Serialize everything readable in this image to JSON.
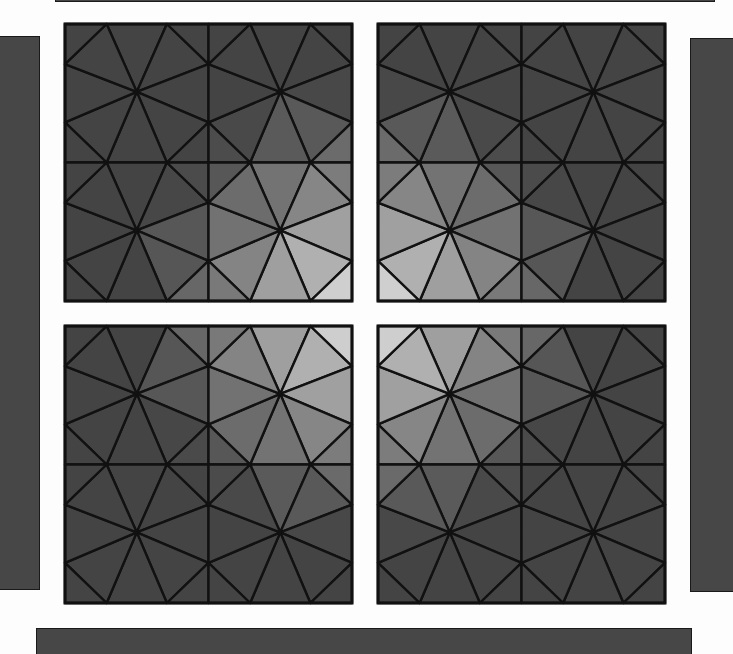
{
  "canvas": {
    "width": 733,
    "height": 654,
    "background": "#fdfdfd"
  },
  "center": {
    "x": 365,
    "y": 313
  },
  "colors": {
    "line": "#111111",
    "bar_fill": "#474747",
    "lightest": "#e8e8e8",
    "darkest": "#454545"
  },
  "bars": [
    {
      "name": "top-bar-edge",
      "x": 55,
      "y": -8,
      "w": 660,
      "h": 10
    },
    {
      "name": "left-bar",
      "x": -2,
      "y": 36,
      "w": 42,
      "h": 554
    },
    {
      "name": "right-bar",
      "x": 690,
      "y": 38,
      "w": 45,
      "h": 554
    },
    {
      "name": "bottom-bar",
      "x": 36,
      "y": 628,
      "w": 656,
      "h": 30
    }
  ],
  "panels": [
    {
      "name": "panel-top-left",
      "x": 65,
      "y": 24,
      "w": 287,
      "h": 277
    },
    {
      "name": "panel-top-right",
      "x": 378,
      "y": 24,
      "w": 287,
      "h": 277
    },
    {
      "name": "panel-bottom-left",
      "x": 65,
      "y": 326,
      "w": 287,
      "h": 277
    },
    {
      "name": "panel-bottom-right",
      "x": 378,
      "y": 326,
      "w": 287,
      "h": 277
    }
  ],
  "tile_geometry": {
    "grid": 2,
    "edge_fraction": 0.29,
    "hub": {
      "fx": 0.5,
      "fy": 0.49
    }
  },
  "shading": {
    "near_distance": 20,
    "far_distance": 230,
    "light_value": 232,
    "dark_value": 68
  }
}
